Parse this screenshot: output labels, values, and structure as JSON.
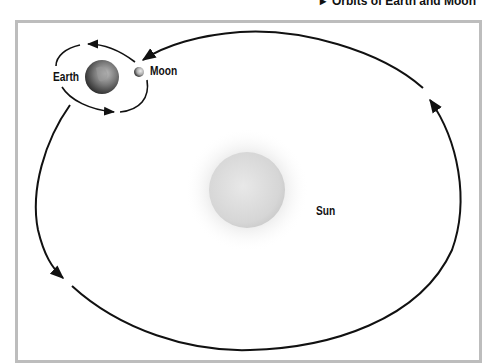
{
  "title": {
    "bullet": "▸",
    "text": "Orbits of Earth and Moon"
  },
  "labels": {
    "earth": "Earth",
    "moon": "Moon",
    "sun": "Sun"
  },
  "colors": {
    "frame_border": "#bdbdbd",
    "orbit_line": "#111111",
    "sun_fill": "#d9d9d9",
    "sun_glow": "#eeeeee",
    "earth_fill": "#6f6f6f",
    "moon_fill": "#b5b5b5",
    "background": "#ffffff"
  }
}
